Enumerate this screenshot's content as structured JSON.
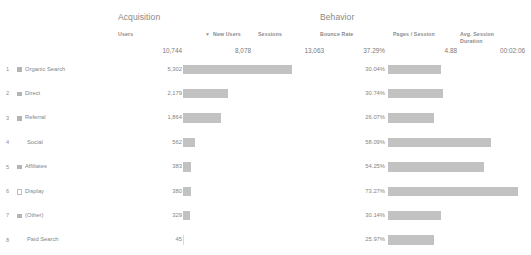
{
  "report": {
    "groups": [
      {
        "name": "acquisition-group",
        "label": "Acquisition"
      },
      {
        "name": "behavior-group",
        "label": "Behavior"
      }
    ],
    "columns": [
      {
        "name": "users",
        "label": "Users",
        "sorted": true,
        "sort_indicator": "▼"
      },
      {
        "name": "new-users",
        "label": "New Users",
        "sorted": false,
        "sort_indicator": ""
      },
      {
        "name": "sessions",
        "label": "Sessions",
        "sorted": false,
        "sort_indicator": ""
      },
      {
        "name": "bounce-rate",
        "label": "Bounce Rate",
        "sorted": false,
        "sort_indicator": ""
      },
      {
        "name": "pages-session",
        "label": "Pages / Session",
        "sorted": false,
        "sort_indicator": ""
      },
      {
        "name": "avg-session-duration",
        "label": "Avg. Session Duration",
        "sorted": false,
        "sort_indicator": ""
      }
    ],
    "totals": {
      "users": "10,744",
      "new_users": "8,078",
      "sessions": "13,063",
      "bounce_rate": "37.29%",
      "pages_per_session": "4.88",
      "avg_session_duration": "00:02:06"
    },
    "rows": [
      {
        "index": "1",
        "label": "Organic Search",
        "marker": "filled",
        "users": "5,302",
        "bounce_rate": "30.04%"
      },
      {
        "index": "2",
        "label": "Direct",
        "marker": "filled",
        "users": "2,179",
        "bounce_rate": "30.74%"
      },
      {
        "index": "3",
        "label": "Referral",
        "marker": "filled",
        "users": "1,864",
        "bounce_rate": "26.07%"
      },
      {
        "index": "4",
        "label": "Social",
        "marker": "none",
        "users": "562",
        "bounce_rate": "58.09%"
      },
      {
        "index": "5",
        "label": "Affiliates",
        "marker": "filled",
        "users": "383",
        "bounce_rate": "54.25%"
      },
      {
        "index": "6",
        "label": "Display",
        "marker": "hollow",
        "users": "380",
        "bounce_rate": "73.27%"
      },
      {
        "index": "7",
        "label": "(Other)",
        "marker": "filled",
        "users": "329",
        "bounce_rate": "30.14%"
      },
      {
        "index": "8",
        "label": "Paid Search",
        "marker": "none",
        "users": "45",
        "bounce_rate": "25.97%"
      }
    ]
  },
  "chart_data": {
    "type": "bar",
    "categories": [
      "Organic Search",
      "Direct",
      "Referral",
      "Social",
      "Affiliates",
      "Display",
      "(Other)",
      "Paid Search"
    ],
    "series": [
      {
        "name": "Users",
        "values": [
          5302,
          2179,
          1864,
          562,
          383,
          380,
          329,
          45
        ],
        "max": 10744
      },
      {
        "name": "Bounce Rate",
        "values": [
          30.04,
          30.74,
          26.07,
          58.09,
          54.25,
          73.27,
          30.14,
          25.97
        ],
        "max": 100,
        "unit": "%"
      }
    ],
    "xlabel": "",
    "ylabel": "",
    "grid": false,
    "legend": "none"
  },
  "layout": {
    "bar_users_max_px": 110,
    "bar_bounce_max_px": 130,
    "bar_bounce_scale_ref": 73.27
  },
  "colors": {
    "bar": "#c2c2c2",
    "text": "#858585",
    "background": "#ffffff"
  }
}
